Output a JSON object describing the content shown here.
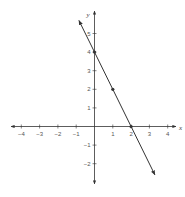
{
  "chart_data": {
    "type": "line",
    "title": "",
    "xlabel": "x",
    "ylabel": "y",
    "xlim": [
      -4,
      4
    ],
    "ylim": [
      -2,
      5
    ],
    "grid": false,
    "x_ticks": [
      -4,
      -3,
      -2,
      -1,
      1,
      2,
      3,
      4
    ],
    "x_tick_labels": [
      "−4",
      "−3",
      "−2",
      "−1",
      "1",
      "2",
      "3",
      "4"
    ],
    "y_ticks": [
      5,
      4,
      3,
      2,
      1,
      -1,
      -2
    ],
    "y_tick_labels": [
      "5",
      "4",
      "3",
      "2",
      "1",
      "−1",
      "−2"
    ],
    "series": [
      {
        "name": "y = -2x + 4",
        "equation": "y = -2x + 4",
        "line_start": [
          -0.85,
          5.7
        ],
        "line_end": [
          3.3,
          -2.6
        ],
        "arrows": "both",
        "marked_points": [
          [
            0,
            4
          ],
          [
            1,
            2
          ],
          [
            2,
            0
          ]
        ]
      }
    ],
    "colors": {
      "axes": "#333333",
      "line": "#333333",
      "labels": "#555555"
    }
  }
}
